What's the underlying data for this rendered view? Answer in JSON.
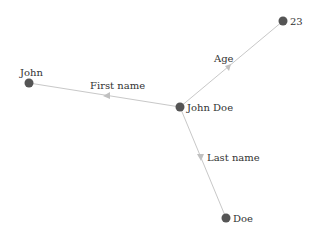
{
  "graph": {
    "nodes": [
      {
        "id": "john_doe",
        "label": "John Doe",
        "x": 180,
        "y": 107
      },
      {
        "id": "john",
        "label": "John",
        "x": 29,
        "y": 83
      },
      {
        "id": "age_value",
        "label": "23",
        "x": 283,
        "y": 21
      },
      {
        "id": "doe",
        "label": "Doe",
        "x": 226,
        "y": 218
      }
    ],
    "edges": [
      {
        "from": "john_doe",
        "to": "john",
        "label": "First name"
      },
      {
        "from": "john_doe",
        "to": "age_value",
        "label": "Age"
      },
      {
        "from": "john_doe",
        "to": "doe",
        "label": "Last name"
      }
    ]
  },
  "colors": {
    "node": "#555555",
    "edge": "#c8c8c8",
    "arrow": "#c0c0c0",
    "text": "#333333"
  }
}
